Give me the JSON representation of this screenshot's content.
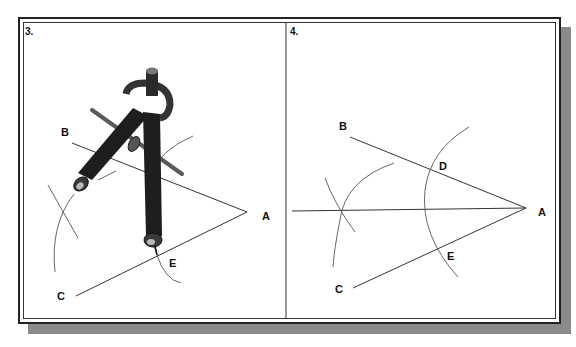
{
  "figure": {
    "panels": [
      {
        "step_label": "3.",
        "points": {
          "A": "A",
          "B": "B",
          "C": "C",
          "E": "E"
        },
        "description": "Compass placed at point E on line AC drawing an arc toward the angle bisector"
      },
      {
        "step_label": "4.",
        "points": {
          "A": "A",
          "B": "B",
          "C": "C",
          "D": "D",
          "E": "E"
        },
        "description": "Intersecting arcs from D and E with bisector line drawn through vertex A"
      }
    ],
    "colors": {
      "line": "#333333",
      "arc": "#555555",
      "frame": "#222222",
      "shadow": "#8a8a8a",
      "compass": "#1e1e1e"
    }
  }
}
